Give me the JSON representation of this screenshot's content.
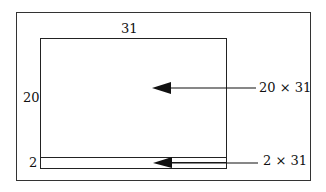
{
  "diagram": {
    "dimensions": {
      "width_label": "31",
      "height_label": "20",
      "strip_height_label": "2"
    },
    "annotations": {
      "main_area": "20 × 31",
      "strip_area": "2 × 31"
    },
    "colors": {
      "line": "#222222",
      "background": "#ffffff"
    }
  }
}
